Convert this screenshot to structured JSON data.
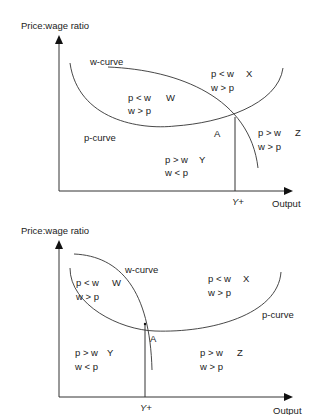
{
  "diagrams": [
    {
      "id": "top",
      "y_axis_label": "Price:wage ratio",
      "x_axis_label": "Output",
      "x_marker_label": "Y+",
      "point_label": "A",
      "curve_labels": {
        "w_curve": "w-curve",
        "p_curve": "p-curve"
      },
      "regions": [
        {
          "id": "W",
          "line1": "p < w",
          "line2": "w > p",
          "letter": "W"
        },
        {
          "id": "X",
          "line1": "p < w",
          "line2": "w > p",
          "letter": "X"
        },
        {
          "id": "Y",
          "line1": "p > w",
          "line2": "w < p",
          "letter": "Y"
        },
        {
          "id": "Z",
          "line1": "p > w",
          "line2": "w > p",
          "letter": "Z"
        }
      ]
    },
    {
      "id": "bottom",
      "y_axis_label": "Price:wage ratio",
      "x_axis_label": "Output",
      "x_marker_label": "Y+",
      "point_label": "A",
      "curve_labels": {
        "w_curve": "w-curve",
        "p_curve": "p-curve"
      },
      "regions": [
        {
          "id": "W",
          "line1": "p < w",
          "line2": "w > p",
          "letter": "W"
        },
        {
          "id": "X",
          "line1": "p < w",
          "line2": "w > p",
          "letter": "X"
        },
        {
          "id": "Y",
          "line1": "p > w",
          "line2": "w < p",
          "letter": "Y"
        },
        {
          "id": "Z",
          "line1": "p > w",
          "line2": "w > p",
          "letter": "Z"
        }
      ]
    }
  ]
}
